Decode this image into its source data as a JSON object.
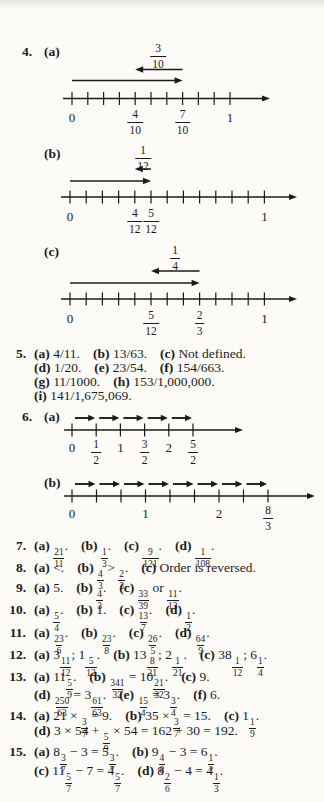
{
  "page": {
    "background": "#fcfbf8",
    "ink": "#1b1b1b"
  },
  "figures": [
    {
      "id": "4a",
      "number_label": "4.",
      "item_label": "(a)",
      "jump_fraction": {
        "num": "3",
        "den": "10"
      },
      "forward_arrow": {
        "from_tick": 0,
        "to_tick": 7
      },
      "back_arrow": {
        "from_tick": 7,
        "to_tick": 4
      },
      "tick_count": 11,
      "tick_labels": [
        {
          "tick": 0,
          "text": "0"
        },
        {
          "tick": 4,
          "num": "4",
          "den": "10"
        },
        {
          "tick": 7,
          "num": "7",
          "den": "10"
        },
        {
          "tick": 10,
          "text": "1"
        }
      ]
    },
    {
      "id": "4b",
      "item_label": "(b)",
      "jump_fraction": {
        "num": "1",
        "den": "12"
      },
      "forward_arrow": {
        "from_tick": 0,
        "to_tick": 5
      },
      "back_arrow": {
        "from_tick": 5,
        "to_tick": 4
      },
      "tick_count": 13,
      "tick_labels": [
        {
          "tick": 0,
          "text": "0"
        },
        {
          "tick": 4,
          "num": "4",
          "den": "12"
        },
        {
          "tick": 5,
          "num": "5",
          "den": "12"
        },
        {
          "tick": 12,
          "text": "1"
        }
      ]
    },
    {
      "id": "4c",
      "item_label": "(c)",
      "jump_fraction": {
        "num": "1",
        "den": "4"
      },
      "forward_arrow": {
        "from_tick": 0,
        "to_tick": 8
      },
      "back_arrow": {
        "from_tick": 8,
        "to_tick": 5
      },
      "tick_count": 13,
      "tick_labels": [
        {
          "tick": 0,
          "text": "0"
        },
        {
          "tick": 5,
          "num": "5",
          "den": "12"
        },
        {
          "tick": 8,
          "num": "2",
          "den": "3"
        },
        {
          "tick": 12,
          "text": "1"
        }
      ]
    },
    {
      "id": "6a",
      "number_label": "6.",
      "item_label": "(a)",
      "hops": 5,
      "tick_count": 6,
      "tick_labels": [
        {
          "tick": 0,
          "text": "0"
        },
        {
          "tick": 1,
          "num": "1",
          "den": "2"
        },
        {
          "tick": 2,
          "text": "1"
        },
        {
          "tick": 3,
          "num": "3",
          "den": "2"
        },
        {
          "tick": 4,
          "text": "2"
        },
        {
          "tick": 5,
          "num": "5",
          "den": "2"
        }
      ]
    },
    {
      "id": "6b",
      "item_label": "(b)",
      "hops": 8,
      "tick_count": 9,
      "tick_labels": [
        {
          "tick": 0,
          "text": "0"
        },
        {
          "tick": 3,
          "text": "1"
        },
        {
          "tick": 6,
          "text": "2"
        },
        {
          "tick": 8,
          "num": "8",
          "den": "3"
        }
      ]
    }
  ],
  "answer_lines": [
    {
      "id": "5-1",
      "num": "5.",
      "tokens": [
        {
          "b": "(a)"
        },
        {
          "t": " 4/11."
        },
        {
          "g": 1
        },
        {
          "b": "(b)"
        },
        {
          "t": " 13/63."
        },
        {
          "g": 1
        },
        {
          "b": "(c)"
        },
        {
          "t": " Not defined."
        }
      ]
    },
    {
      "id": "5-2",
      "num": "",
      "tokens": [
        {
          "b": "(d)"
        },
        {
          "t": " 1/20."
        },
        {
          "g": 1
        },
        {
          "b": "(e)"
        },
        {
          "t": " 23/54."
        },
        {
          "g": 1
        },
        {
          "b": "(f)"
        },
        {
          "t": " 154/663."
        }
      ]
    },
    {
      "id": "5-3",
      "num": "",
      "tokens": [
        {
          "b": "(g)"
        },
        {
          "t": " 11/1000."
        },
        {
          "g": 1
        },
        {
          "b": "(h)"
        },
        {
          "t": " 153/1,000,000."
        }
      ]
    },
    {
      "id": "5-4",
      "num": "",
      "tokens": [
        {
          "b": "(i)"
        },
        {
          "t": " 141/1,675,069."
        }
      ]
    },
    {
      "id": "7",
      "num": "7.",
      "tokens": [
        {
          "b": "(a)"
        },
        {
          "t": " "
        },
        {
          "f": [
            "21",
            "11"
          ]
        },
        {
          "t": "."
        },
        {
          "g": 1
        },
        {
          "b": "(b)"
        },
        {
          "t": " "
        },
        {
          "f": [
            "1",
            "3"
          ]
        },
        {
          "t": "."
        },
        {
          "g": 1
        },
        {
          "b": "(c)"
        },
        {
          "t": " "
        },
        {
          "f": [
            "9",
            "121"
          ]
        },
        {
          "t": "."
        },
        {
          "g": 1
        },
        {
          "b": "(d)"
        },
        {
          "t": " "
        },
        {
          "f": [
            "1",
            "108"
          ]
        },
        {
          "t": "."
        }
      ]
    },
    {
      "id": "8",
      "num": "8.",
      "tokens": [
        {
          "b": "(a)"
        },
        {
          "t": " <."
        },
        {
          "g": 1
        },
        {
          "b": "(b)"
        },
        {
          "t": " "
        },
        {
          "f": [
            "4",
            "3"
          ]
        },
        {
          "t": " > "
        },
        {
          "f": [
            "2",
            "3"
          ]
        },
        {
          "t": "."
        },
        {
          "g": 1
        },
        {
          "b": "(c)"
        },
        {
          "t": " Order is reversed."
        }
      ]
    },
    {
      "id": "9",
      "num": "9.",
      "tokens": [
        {
          "b": "(a)"
        },
        {
          "t": " 5."
        },
        {
          "g": 1
        },
        {
          "b": "(b)"
        },
        {
          "t": " "
        },
        {
          "f": [
            "4",
            "3"
          ]
        },
        {
          "t": "."
        },
        {
          "g": 1
        },
        {
          "b": "(c)"
        },
        {
          "t": " "
        },
        {
          "f": [
            "33",
            "39"
          ]
        },
        {
          "t": " or "
        },
        {
          "f": [
            "11",
            "13"
          ]
        },
        {
          "t": "."
        }
      ]
    },
    {
      "id": "10",
      "num": "10.",
      "tokens": [
        {
          "b": "(a)"
        },
        {
          "t": " "
        },
        {
          "f": [
            "5",
            "4"
          ]
        },
        {
          "t": "."
        },
        {
          "g": 1
        },
        {
          "b": "(b)"
        },
        {
          "t": " 1."
        },
        {
          "g": 1
        },
        {
          "b": "(c)"
        },
        {
          "t": " "
        },
        {
          "f": [
            "13",
            "7"
          ]
        },
        {
          "t": "."
        },
        {
          "g": 1
        },
        {
          "b": "(d)"
        },
        {
          "t": " "
        },
        {
          "f": [
            "1",
            "2"
          ]
        },
        {
          "t": "."
        }
      ]
    },
    {
      "id": "11",
      "num": "11.",
      "tokens": [
        {
          "b": "(a)"
        },
        {
          "t": " "
        },
        {
          "f": [
            "23",
            "6"
          ]
        },
        {
          "t": "."
        },
        {
          "g": 1
        },
        {
          "b": "(b)"
        },
        {
          "t": " "
        },
        {
          "f": [
            "23",
            "8"
          ]
        },
        {
          "t": "."
        },
        {
          "g": 1
        },
        {
          "b": "(c)"
        },
        {
          "t": " "
        },
        {
          "f": [
            "26",
            "5"
          ]
        },
        {
          "t": "."
        },
        {
          "g": 1
        },
        {
          "b": "(d)"
        },
        {
          "t": " "
        },
        {
          "f": [
            "64",
            "9"
          ]
        },
        {
          "t": "."
        }
      ]
    },
    {
      "id": "12",
      "num": "12.",
      "tokens": [
        {
          "b": "(a)"
        },
        {
          "t": " "
        },
        {
          "m": [
            "3",
            "11",
            "12"
          ]
        },
        {
          "t": "; "
        },
        {
          "m": [
            "1",
            "5",
            "12"
          ]
        },
        {
          "t": "."
        },
        {
          "g": 1
        },
        {
          "b": "(b)"
        },
        {
          "t": " "
        },
        {
          "m": [
            "13",
            "8",
            "21"
          ]
        },
        {
          "t": "; "
        },
        {
          "m": [
            "2",
            "1",
            "21"
          ]
        },
        {
          "t": "."
        },
        {
          "g": 1
        },
        {
          "b": "(c)"
        },
        {
          "t": " "
        },
        {
          "m": [
            "38",
            "1",
            "12"
          ]
        },
        {
          "t": "; "
        },
        {
          "m": [
            "6",
            "1",
            "4"
          ]
        },
        {
          "t": "."
        }
      ]
    },
    {
      "id": "13-1",
      "num": "13.",
      "tokens": [
        {
          "b": "(a)"
        },
        {
          "t": " "
        },
        {
          "m": [
            "11",
            "5",
            "9"
          ]
        },
        {
          "t": "."
        },
        {
          "g": 1
        },
        {
          "b": "(b)"
        },
        {
          "t": " "
        },
        {
          "f": [
            "341",
            "32"
          ]
        },
        {
          "t": " = "
        },
        {
          "m": [
            "10",
            "21",
            "32"
          ]
        },
        {
          "t": "."
        },
        {
          "g": 1
        },
        {
          "b": "(c)"
        },
        {
          "t": " 9."
        }
      ]
    },
    {
      "id": "13-2",
      "num": "",
      "tokens": [
        {
          "b": "(d)"
        },
        {
          "t": " "
        },
        {
          "f": [
            "250",
            "63"
          ]
        },
        {
          "t": " = "
        },
        {
          "m": [
            "3",
            "61",
            "63"
          ]
        },
        {
          "t": "."
        },
        {
          "g": 1
        },
        {
          "b": "(e)"
        },
        {
          "t": " "
        },
        {
          "f": [
            "15",
            "4"
          ]
        },
        {
          "t": " = "
        },
        {
          "m": [
            "3",
            "3",
            "4"
          ]
        },
        {
          "t": "."
        },
        {
          "g": 1
        },
        {
          "b": "(f)"
        },
        {
          "t": " 6."
        }
      ]
    },
    {
      "id": "14-1",
      "num": "14.",
      "tokens": [
        {
          "b": "(a)"
        },
        {
          "t": " 21 × "
        },
        {
          "f": [
            "3",
            "7"
          ]
        },
        {
          "t": " = 9."
        },
        {
          "g": 1
        },
        {
          "b": "(b)"
        },
        {
          "t": " 35 × "
        },
        {
          "f": [
            "3",
            "7"
          ]
        },
        {
          "t": " = 15."
        },
        {
          "g": 1
        },
        {
          "b": "(c)"
        },
        {
          "t": " "
        },
        {
          "m": [
            "1",
            "1",
            "9"
          ]
        },
        {
          "t": "."
        }
      ]
    },
    {
      "id": "14-2",
      "num": "",
      "tokens": [
        {
          "b": "(d)"
        },
        {
          "t": " 3 × 54 + "
        },
        {
          "f": [
            "5",
            "9"
          ]
        },
        {
          "t": " × 54 = 162 + 30 = 192."
        }
      ]
    },
    {
      "id": "15-1",
      "num": "15.",
      "tokens": [
        {
          "b": "(a)"
        },
        {
          "t": " "
        },
        {
          "m": [
            "8",
            "3",
            "7"
          ]
        },
        {
          "t": " − 3 = "
        },
        {
          "m": [
            "5",
            "3",
            "7"
          ]
        },
        {
          "t": "."
        },
        {
          "g": 1
        },
        {
          "b": "(b)"
        },
        {
          "t": " "
        },
        {
          "m": [
            "9",
            "4",
            "8"
          ]
        },
        {
          "t": " − 3 = "
        },
        {
          "m": [
            "6",
            "1",
            "2"
          ]
        },
        {
          "t": "."
        }
      ]
    },
    {
      "id": "15-2",
      "num": "",
      "tokens": [
        {
          "b": "(c)"
        },
        {
          "t": " "
        },
        {
          "m": [
            "11",
            "5",
            "7"
          ]
        },
        {
          "t": " − 7 = "
        },
        {
          "m": [
            "4",
            "5",
            "7"
          ]
        },
        {
          "t": "."
        },
        {
          "g": 1
        },
        {
          "b": "(d)"
        },
        {
          "t": " "
        },
        {
          "m": [
            "8",
            "2",
            "6"
          ]
        },
        {
          "t": " − 4 = "
        },
        {
          "m": [
            "4",
            "1",
            "3"
          ]
        },
        {
          "t": "."
        }
      ]
    }
  ]
}
